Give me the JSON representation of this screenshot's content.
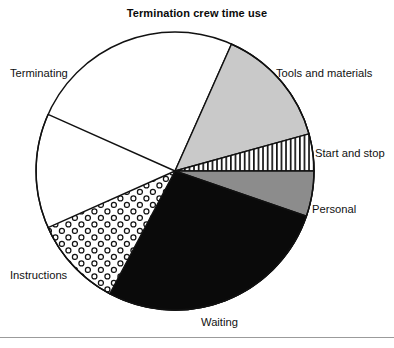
{
  "chart_data": {
    "type": "pie",
    "title": "Termination crew time use",
    "xlabel": "",
    "ylabel": "",
    "legend_position": "outside-labels",
    "grid": false,
    "categories": [
      "Terminating",
      "Tools and materials",
      "Start and stop",
      "Personal",
      "Waiting",
      "Instructions"
    ],
    "values": [
      40.0,
      14.0,
      4.3,
      5.3,
      27.5,
      10.6
    ],
    "units": "percent of crew time",
    "slices": [
      {
        "label": "Terminating",
        "value": 40.0,
        "start_angle_deg": -66,
        "end_angle_deg": 204,
        "fill": "#ffffff",
        "pattern": "solid",
        "stroke": "#111111"
      },
      {
        "label": "Tools and materials",
        "value": 14.0,
        "start_angle_deg": -66,
        "end_angle_deg": -15.5,
        "fill": "#c9c9c9",
        "pattern": "solid",
        "stroke": "#111111"
      },
      {
        "label": "Start and stop",
        "value": 4.3,
        "start_angle_deg": -15.5,
        "end_angle_deg": 0,
        "fill": "#ffffff",
        "pattern": "vertical-lines",
        "stroke": "#111111"
      },
      {
        "label": "Personal",
        "value": 5.3,
        "start_angle_deg": 0,
        "end_angle_deg": 19,
        "fill": "#8c8c8c",
        "pattern": "solid",
        "stroke": "#111111"
      },
      {
        "label": "Waiting",
        "value": 27.5,
        "start_angle_deg": 19,
        "end_angle_deg": 118,
        "fill": "#0a0a0a",
        "pattern": "solid",
        "stroke": "#111111"
      },
      {
        "label": "Instructions",
        "value": 10.6,
        "start_angle_deg": 118,
        "end_angle_deg": 156,
        "fill": "#ffffff",
        "pattern": "circles",
        "stroke": "#111111"
      }
    ],
    "geometry": {
      "center_x": 175,
      "center_y": 171,
      "radius": 139
    },
    "label_positions": [
      {
        "label": "Terminating",
        "x": 10,
        "y": 68,
        "align": "left"
      },
      {
        "label": "Tools and materials",
        "x": 276,
        "y": 68,
        "align": "left"
      },
      {
        "label": "Start and stop",
        "x": 315,
        "y": 148,
        "align": "left"
      },
      {
        "label": "Personal",
        "x": 312,
        "y": 204,
        "align": "left"
      },
      {
        "label": "Waiting",
        "x": 201,
        "y": 317,
        "align": "left"
      },
      {
        "label": "Instructions",
        "x": 10,
        "y": 270,
        "align": "left"
      }
    ]
  },
  "colors": {
    "background": "#ffffff",
    "outline": "#111111",
    "text": "#111111",
    "tools_and_materials": "#c9c9c9",
    "personal": "#8c8c8c",
    "waiting": "#0a0a0a",
    "footer_rule": "#9b9b9b"
  }
}
